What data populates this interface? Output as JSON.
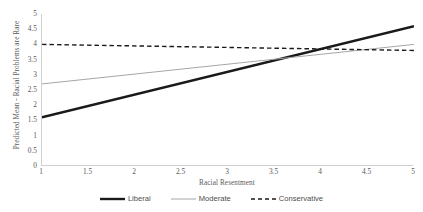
{
  "chart_data": {
    "type": "line",
    "title": "",
    "xlabel": "Racial Resentment",
    "ylabel": "Predicted Mean - Racial Problems are Rare",
    "xlim": [
      1,
      5
    ],
    "ylim": [
      0,
      5
    ],
    "grid": false,
    "legend_position": "bottom",
    "xticks": [
      "1",
      "1.5",
      "2",
      "2.5",
      "3",
      "3.5",
      "4",
      "4.5",
      "5"
    ],
    "xtick_values": [
      1,
      1.5,
      2,
      2.5,
      3,
      3.5,
      4,
      4.5,
      5
    ],
    "yticks": [
      "0",
      "0.5",
      "1",
      "1.5",
      "2",
      "2.5",
      "3",
      "3.5",
      "4",
      "4.5",
      "5"
    ],
    "ytick_values": [
      0,
      0.5,
      1,
      1.5,
      2,
      2.5,
      3,
      3.5,
      4,
      4.5,
      5
    ],
    "x": [
      1,
      5
    ],
    "series": [
      {
        "name": "Liberal",
        "values": [
          1.6,
          4.6
        ],
        "style": "solid",
        "width": 2.4,
        "color": "#1a1a1a"
      },
      {
        "name": "Moderate",
        "values": [
          2.7,
          4.0
        ],
        "style": "solid",
        "width": 1.0,
        "color": "#a6a6a6"
      },
      {
        "name": "Conservative",
        "values": [
          4.0,
          3.8
        ],
        "style": "dashed",
        "width": 1.4,
        "color": "#1a1a1a"
      }
    ]
  },
  "colors": {
    "background": "#ffffff",
    "axis": "#d0d0d0",
    "text": "#5a5a5a",
    "liberal": "#1a1a1a",
    "moderate": "#a6a6a6",
    "conservative": "#1a1a1a"
  },
  "axes": {
    "x_title": "Racial Resentment",
    "y_title": "Predicted Mean - Racial Problems are Rare"
  },
  "legend": {
    "items": [
      {
        "label": "Liberal"
      },
      {
        "label": "Moderate"
      },
      {
        "label": "Conservative"
      }
    ]
  }
}
